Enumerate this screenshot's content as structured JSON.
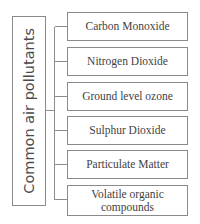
{
  "diagram": {
    "type": "bracket-hierarchy",
    "orientation": "left-root-right-leaves",
    "root": {
      "label": "Common air pollutants",
      "text_direction": "vertical-bottom-to-top"
    },
    "leaves": [
      {
        "label": "Carbon Monoxide"
      },
      {
        "label": "Nitrogen Dioxide"
      },
      {
        "label": "Ground level ozone"
      },
      {
        "label": "Sulphur  Dioxide"
      },
      {
        "label": "Particulate Matter"
      },
      {
        "label": "Volatile organic\ncompounds"
      }
    ],
    "colors": {
      "background": "#ffffff",
      "border": "#8a8a8a",
      "connector": "#8d8d8d",
      "root_text": "#4a4a4a",
      "leaf_text": "#3f3f3f"
    }
  }
}
